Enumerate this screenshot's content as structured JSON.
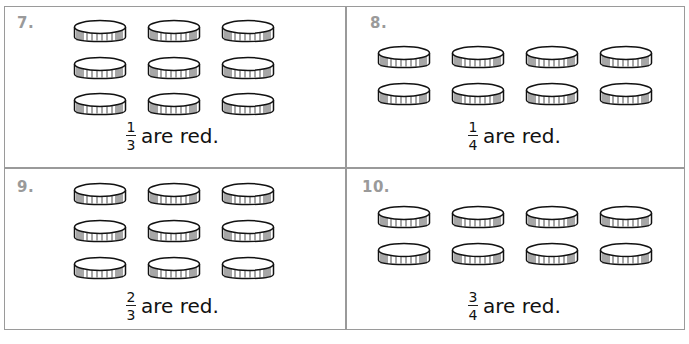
{
  "problems": [
    {
      "number": "7.",
      "coins": 9,
      "columns": 3,
      "numerator": "1",
      "denominator": "3",
      "text": "are red."
    },
    {
      "number": "8.",
      "coins": 8,
      "columns": 4,
      "numerator": "1",
      "denominator": "4",
      "text": "are red."
    },
    {
      "number": "9.",
      "coins": 9,
      "columns": 3,
      "numerator": "2",
      "denominator": "3",
      "text": "are red."
    },
    {
      "number": "10.",
      "coins": 8,
      "columns": 4,
      "numerator": "3",
      "denominator": "4",
      "text": "are red."
    }
  ],
  "colors": {
    "border": "#9a9a9a",
    "number": "#9a9a9a",
    "ink": "#111111"
  }
}
